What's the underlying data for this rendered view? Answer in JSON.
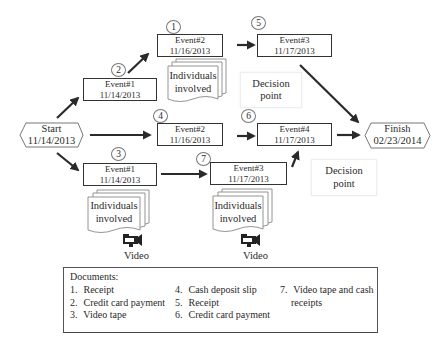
{
  "diagram": {
    "type": "event-flow-timeline",
    "start": {
      "label": "Start",
      "date": "11/14/2013"
    },
    "finish": {
      "label": "Finish",
      "date": "02/23/2014"
    },
    "events": [
      {
        "id": "top-event1",
        "label": "Event#1",
        "date": "11/14/2013",
        "doc_number": "2"
      },
      {
        "id": "top-event2",
        "label": "Event#2",
        "date": "11/16/2013",
        "doc_number": "1"
      },
      {
        "id": "top-event3",
        "label": "Event#3",
        "date": "11/17/2013",
        "doc_number": "5"
      },
      {
        "id": "mid-event2",
        "label": "Event#2",
        "date": "11/16/2013",
        "doc_number": "4"
      },
      {
        "id": "mid-event4",
        "label": "Event#4",
        "date": "11/17/2013",
        "doc_number": "6"
      },
      {
        "id": "bot-event1",
        "label": "Event#1",
        "date": "11/14/2013",
        "doc_number": "3"
      },
      {
        "id": "bot-event3",
        "label": "Event#3",
        "date": "11/17/2013",
        "doc_number": "7"
      }
    ],
    "individuals": [
      {
        "line1": "Individuals",
        "line2": "involved"
      },
      {
        "line1": "Individuals",
        "line2": "involved"
      },
      {
        "line1": "Individuals",
        "line2": "involved"
      }
    ],
    "decision_points": [
      {
        "line1": "Decision",
        "line2": "point"
      },
      {
        "line1": "Decision",
        "line2": "point"
      }
    ],
    "video_labels": [
      "Video",
      "Video"
    ],
    "icons": {
      "video": "video-camera-icon"
    },
    "colors": {
      "stroke": "#333333",
      "arrow": "#2a2a2a",
      "background": "#ffffff"
    }
  },
  "documents": {
    "title": "Documents:",
    "items": [
      {
        "num": "1.",
        "text": "Receipt"
      },
      {
        "num": "2.",
        "text": "Credit card payment"
      },
      {
        "num": "3.",
        "text": "Video tape"
      },
      {
        "num": "4.",
        "text": "Cash deposit slip"
      },
      {
        "num": "5.",
        "text": "Receipt"
      },
      {
        "num": "6.",
        "text": "Credit card payment"
      },
      {
        "num": "7.",
        "text": "Video tape and cash",
        "text_cont": "receipts"
      }
    ]
  }
}
